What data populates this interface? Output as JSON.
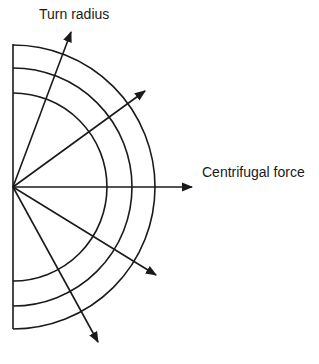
{
  "labels": {
    "turn_radius": "Turn radius",
    "centrifugal_force": "Centrifugal force"
  },
  "colors": {
    "stroke": "#1a1a1a",
    "background": "#ffffff"
  },
  "geometry": {
    "center": [
      13,
      187
    ],
    "arc_radii": [
      94,
      119,
      142
    ],
    "arrows": [
      {
        "name": "arrow-top",
        "to": [
          71,
          32
        ]
      },
      {
        "name": "arrow-upper-right",
        "to": [
          145,
          91
        ]
      },
      {
        "name": "arrow-right",
        "to": [
          192,
          187
        ]
      },
      {
        "name": "arrow-lower-right",
        "to": [
          156,
          275
        ]
      },
      {
        "name": "arrow-bottom",
        "to": [
          98,
          342
        ]
      }
    ]
  }
}
